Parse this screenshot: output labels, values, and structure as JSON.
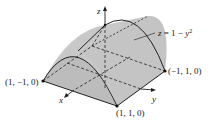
{
  "figure": {
    "type": "3d-surface-diagram",
    "surface_label": "z = 1 − y²",
    "surface_label_parts": {
      "lhs": "z",
      "eq": " = 1 − ",
      "var": "y",
      "exp": "2"
    },
    "axes": {
      "x": "x",
      "y": "y",
      "z": "z"
    },
    "points": [
      {
        "label": "(1, −1, 0)"
      },
      {
        "label": "(1, 1, 0)"
      },
      {
        "label": "(−1, 1, 0)"
      }
    ],
    "colors": {
      "surface_fill": "#c9c9c9",
      "surface_side": "#bdbdbd",
      "edge": "#222222",
      "dashed": "#333333"
    }
  }
}
